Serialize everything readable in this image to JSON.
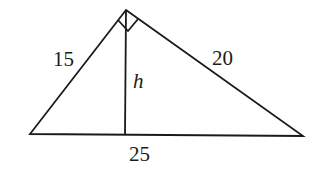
{
  "diagram": {
    "type": "right-triangle-with-altitude",
    "labels": {
      "left_leg": "15",
      "right_leg": "20",
      "altitude": "h",
      "hypotenuse": "25"
    },
    "right_angle_marker": "apex",
    "colors": {
      "stroke": "#1a1a1a",
      "background": "#ffffff"
    }
  }
}
